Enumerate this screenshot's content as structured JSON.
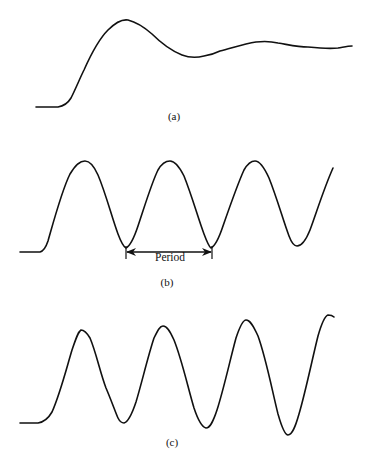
{
  "figure": {
    "panels": [
      {
        "id": "a",
        "label": "(a)",
        "description": "Overshoot then damped settling response",
        "path": "M36,107 L58,107 C64,106 68,103 71,98 C76,88 80,78 84,70 C92,52 100,38 108,30 C116,22 122,19 128,20 C136,22 144,27 152,34 C162,44 172,51 182,55 C190,58 196,58 204,56 C210,55 214,54 220,51 C232,48 244,44 256,42 C264,41 270,41 278,43 C290,45 298,47 308,47 C318,48 328,49 338,48 C344,47 348,46 352,46"
      },
      {
        "id": "b",
        "label": "(b)",
        "description": "Sustained constant-amplitude oscillation",
        "path": "M20,252 L40,252 C44,251 46,247 48,241 C54,220 62,190 70,174 C76,164 80,161 85,161 C90,161 94,166 98,175 C106,194 112,218 118,234 C121,242 124,247 126,248 C130,246 134,238 138,226 C146,202 152,182 158,170 C162,163 166,161 170,161 C175,161 179,166 184,176 C192,196 198,218 204,234 C207,242 209,247 211,248 C215,246 219,238 223,226 C231,203 238,183 244,170 C248,163 251,161 255,161 C260,161 264,167 269,178 C277,198 283,220 289,236 C292,244 295,246 297,246 C302,246 306,240 310,230 C316,214 324,188 333,168",
        "annotation": {
          "text": "Period",
          "x_start": 126,
          "x_end": 212,
          "y": 252
        }
      },
      {
        "id": "c",
        "label": "(c)",
        "description": "Growing-amplitude (unstable) oscillation",
        "path": "M20,423 L38,423 C44,422 48,419 52,412 C60,394 66,370 72,350 C76,338 78,332 81,330 C84,330 87,333 90,338 C96,352 100,372 106,388 C112,402 116,414 118,418 C120,422 122,423 124,423 C128,422 132,414 136,402 C142,382 148,356 154,338 C158,330 160,326 163,326 C167,326 170,331 174,340 C182,360 188,388 194,408 C198,420 202,427 206,428 C210,428 213,422 217,410 C224,388 230,360 236,338 C240,326 243,320 246,320 C250,320 253,325 258,336 C266,358 272,390 278,414 C282,428 285,435 288,435 C292,435 295,428 299,414 C306,390 312,360 318,336 C322,322 325,316 328,315 C330,315 332,315 334,317"
      }
    ]
  }
}
